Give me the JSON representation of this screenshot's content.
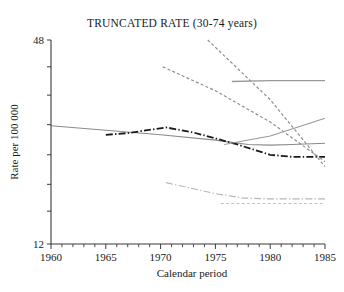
{
  "chart_data": {
    "type": "line",
    "title": "TRUNCATED RATE (30-74 years)",
    "xlabel": "Calendar period",
    "ylabel": "Rate per 100 000",
    "xlim": [
      1960,
      1985
    ],
    "ylim": [
      12,
      48
    ],
    "yscale": "log",
    "grid": false,
    "legend": "none",
    "x_tick_labels": [
      "1960",
      "1965",
      "1970",
      "1975",
      "1980",
      "1985"
    ],
    "x_ticks": [
      1960,
      1965,
      1970,
      1975,
      1980,
      1985
    ],
    "x_minor_tick_step": 1,
    "y_tick_labels": [
      "48",
      "12"
    ],
    "y_ticks": [
      48,
      12
    ],
    "series": [
      {
        "name": "series-a-gray-solid-declining",
        "style": "solid",
        "color": "#8a8a8a",
        "width": 1.1,
        "x": [
          1960,
          1965,
          1970,
          1975,
          1978,
          1980,
          1982,
          1985
        ],
        "y": [
          26.8,
          26.0,
          25.2,
          24.3,
          23.6,
          23.5,
          23.6,
          23.8
        ]
      },
      {
        "name": "series-b-black-dashdot",
        "style": "dashdot",
        "color": "#1a1a1a",
        "width": 1.8,
        "x": [
          1965,
          1967,
          1970.5,
          1973,
          1975,
          1977,
          1980,
          1982,
          1985
        ],
        "y": [
          25.2,
          25.5,
          26.5,
          25.6,
          24.6,
          23.6,
          22.0,
          21.7,
          21.7
        ]
      },
      {
        "name": "series-c-gray-dashed-steep-upper",
        "style": "dashed",
        "color": "#8f8f8f",
        "width": 1.2,
        "x": [
          1974.3,
          1980,
          1985
        ],
        "y": [
          48.0,
          32.0,
          20.3
        ]
      },
      {
        "name": "series-d-gray-dashed-mid",
        "style": "dashed",
        "color": "#8f8f8f",
        "width": 1.2,
        "x": [
          1970.2,
          1975,
          1980,
          1985
        ],
        "y": [
          40.0,
          34.0,
          27.5,
          21.0
        ]
      },
      {
        "name": "series-e-gray-solid-flat-top",
        "style": "solid",
        "color": "#9a9a9a",
        "width": 1.3,
        "x": [
          1976.5,
          1980,
          1985
        ],
        "y": [
          36.2,
          36.4,
          36.4
        ]
      },
      {
        "name": "series-f-gray-solid-rising",
        "style": "solid",
        "color": "#9a9a9a",
        "width": 1.2,
        "x": [
          1975.8,
          1980,
          1985
        ],
        "y": [
          23.6,
          25.0,
          28.2
        ]
      },
      {
        "name": "series-g-light-dashdot-lower",
        "style": "dashdot",
        "color": "#b6b6b6",
        "width": 1.2,
        "x": [
          1970.5,
          1975,
          1977.5,
          1980,
          1985
        ],
        "y": [
          18.2,
          16.9,
          16.4,
          16.3,
          16.3
        ]
      },
      {
        "name": "series-h-light-dashed-lower-flat",
        "style": "dashed",
        "color": "#c2c2c2",
        "width": 1.2,
        "x": [
          1975.5,
          1980,
          1985
        ],
        "y": [
          15.8,
          15.8,
          15.8
        ]
      }
    ]
  }
}
